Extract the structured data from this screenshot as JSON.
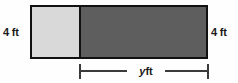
{
  "figure": {
    "type": "geometry-diagram",
    "background_color": "#fefefe"
  },
  "labels": {
    "left_height": "4 ft",
    "right_height": "4 ft",
    "width_variable": "y",
    "width_unit": "ft"
  },
  "regions": [
    {
      "name": "square",
      "fill": "#d9d9d9",
      "position": "left"
    },
    {
      "name": "rectangle",
      "fill": "#5e5e5e",
      "position": "right"
    }
  ],
  "style": {
    "outline_color": "#111111",
    "dimension_line_color": "#3a3a3a",
    "text_color": "#1a1a1a"
  }
}
